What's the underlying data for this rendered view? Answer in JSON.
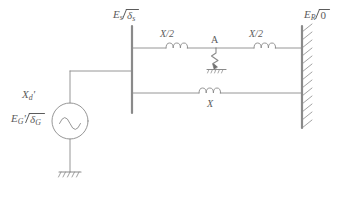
{
  "diagram": {
    "stroke_color": "#8a8a8a",
    "text_color": "#5b5b5b",
    "background": "#ffffff",
    "labels": {
      "sending_bus": {
        "symbol": "E",
        "subscript": "s",
        "angle": "δ",
        "angle_subscript": "s",
        "full": "E_s ∠ δ_s"
      },
      "receiving_bus": {
        "symbol": "E",
        "subscript": "R",
        "angle": "0",
        "angle_subscript": "",
        "full": "E_R ∠ 0"
      },
      "generator_emf": {
        "symbol": "E",
        "subscript": "G",
        "prime": "'",
        "angle": "δ",
        "angle_subscript": "G",
        "full": "E_G' ∠ δ_G"
      },
      "generator_reactance": {
        "symbol": "X",
        "subscript": "d",
        "prime": "'",
        "full": "X_d'"
      },
      "line_upper_left": "X/2",
      "line_upper_right": "X/2",
      "line_lower": "X",
      "fault_point": "A"
    },
    "components": [
      {
        "name": "generator-source",
        "type": "ac-source",
        "label": "E_G' ∠ δ_G"
      },
      {
        "name": "generator-ground",
        "type": "ground"
      },
      {
        "name": "sending-busbar",
        "type": "busbar"
      },
      {
        "name": "receiving-busbar",
        "type": "infinite-bus",
        "hatched": true
      },
      {
        "name": "inductor-upper-left",
        "type": "inductor",
        "label": "X/2"
      },
      {
        "name": "inductor-upper-right",
        "type": "inductor",
        "label": "X/2"
      },
      {
        "name": "inductor-lower",
        "type": "inductor",
        "label": "X"
      },
      {
        "name": "fault-symbol",
        "type": "short-circuit-fault",
        "label": "A"
      },
      {
        "name": "fault-ground",
        "type": "ground"
      }
    ]
  }
}
